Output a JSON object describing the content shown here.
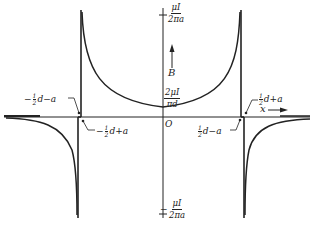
{
  "diagram": {
    "type": "magnetic field plot of two parallel wires",
    "axes": {
      "x_label": "x",
      "y_label": "B",
      "origin_label": "O"
    },
    "labels": {
      "top_value": {
        "num": "μI",
        "den": "2πa"
      },
      "bottom_value": {
        "sign": "−",
        "num": "μI",
        "den": "2πa"
      },
      "center_value": {
        "num": "2μI",
        "den": "πd"
      },
      "left_outer": {
        "prefix": "−",
        "half": [
          "1",
          "2"
        ],
        "rest": "d−a"
      },
      "left_inner": {
        "prefix": "−",
        "half": [
          "1",
          "2"
        ],
        "rest": "d+a"
      },
      "right_inner": {
        "prefix": "",
        "half": [
          "1",
          "2"
        ],
        "rest": "d−a"
      },
      "right_outer": {
        "prefix": "",
        "half": [
          "1",
          "2"
        ],
        "rest": "d+a"
      }
    },
    "colors": {
      "ink": "#222222",
      "background": "#ffffff"
    }
  }
}
